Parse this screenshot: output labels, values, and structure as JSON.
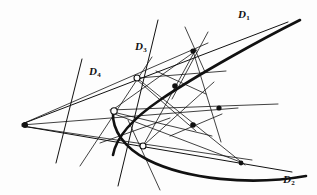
{
  "figure": {
    "kind": "geometry-construction",
    "background_color": "#fdfdfd",
    "ink_color": "#111111",
    "width": 317,
    "height": 195
  },
  "labels": [
    {
      "name": "label-d1",
      "base": "D",
      "sub": "1",
      "text": "D1",
      "x": 238,
      "y": 9,
      "of": "tangent-line-d1"
    },
    {
      "name": "label-d2",
      "base": "D",
      "sub": "2",
      "text": "D2",
      "x": 283,
      "y": 174,
      "of": "tangent-line-d2"
    },
    {
      "name": "label-d3",
      "base": "D",
      "sub": "3",
      "text": "D3",
      "x": 135,
      "y": 41,
      "of": "tangent-line-d3"
    },
    {
      "name": "label-d4",
      "base": "D",
      "sub": "4",
      "text": "D4",
      "x": 89,
      "y": 66,
      "of": "tangent-line-d4"
    }
  ],
  "curve": {
    "name": "parabola",
    "type": "parabola",
    "opens": "right",
    "vertex": [
      113,
      112
    ],
    "stroke_width": 2.6,
    "path_points": [
      [
        296,
        22
      ],
      [
        268,
        36
      ],
      [
        243,
        49
      ],
      [
        220,
        62
      ],
      [
        200,
        74
      ],
      [
        182,
        86
      ],
      [
        166,
        98
      ],
      [
        152,
        110
      ],
      [
        140,
        122
      ],
      [
        131,
        134
      ],
      [
        124,
        146
      ],
      [
        120,
        158
      ],
      [
        119,
        170
      ],
      [
        121,
        182
      ],
      [
        116,
        100
      ],
      [
        113,
        112
      ]
    ],
    "upper_branch": "M 300 20 C 262 39 200 73 160 100 C 132 119 116 138 113 155",
    "lower_branch": "M 113 112 C 112 130 124 148 148 160 C 186 179 250 186 306 176"
  },
  "tangent_lines": [
    {
      "name": "tangent-line-d1",
      "label": "D1",
      "x1": 22,
      "y1": 124,
      "x2": 288,
      "y2": 22,
      "stroke_width": 1.0,
      "touches": "upper-branch"
    },
    {
      "name": "tangent-line-d2",
      "label": "D2",
      "x1": 22,
      "y1": 126,
      "x2": 292,
      "y2": 172,
      "stroke_width": 1.0,
      "touches": "lower-branch"
    },
    {
      "name": "tangent-line-d3",
      "label": "D3",
      "x1": 158,
      "y1": 20,
      "x2": 118,
      "y2": 186,
      "stroke_width": 1.0,
      "touches": "curve-point-t1"
    },
    {
      "name": "tangent-line-d4",
      "label": "D4",
      "x1": 82,
      "y1": 59,
      "x2": 56,
      "y2": 163,
      "stroke_width": 1.0,
      "touches": "curve-point-t2"
    }
  ],
  "construction_lines": [
    {
      "name": "construction-line-1",
      "x1": 22,
      "y1": 124,
      "x2": 208,
      "y2": 43,
      "stroke_width": 0.8
    },
    {
      "name": "construction-line-2",
      "x1": 22,
      "y1": 125,
      "x2": 238,
      "y2": 108,
      "stroke_width": 0.8
    },
    {
      "name": "construction-line-3",
      "x1": 22,
      "y1": 126,
      "x2": 252,
      "y2": 160,
      "stroke_width": 0.8
    },
    {
      "name": "construction-line-4",
      "x1": 110,
      "y1": 110,
      "x2": 278,
      "y2": 104,
      "stroke_width": 0.8
    },
    {
      "name": "construction-line-5",
      "x1": 137,
      "y1": 78,
      "x2": 245,
      "y2": 165,
      "stroke_width": 0.8
    },
    {
      "name": "construction-line-6",
      "x1": 143,
      "y1": 146,
      "x2": 196,
      "y2": 49,
      "stroke_width": 0.8
    },
    {
      "name": "construction-line-7",
      "x1": 111,
      "y1": 111,
      "x2": 197,
      "y2": 50,
      "stroke_width": 0.8
    },
    {
      "name": "construction-line-8",
      "x1": 112,
      "y1": 113,
      "x2": 243,
      "y2": 163,
      "stroke_width": 0.8
    },
    {
      "name": "construction-line-9",
      "x1": 136,
      "y1": 79,
      "x2": 196,
      "y2": 131,
      "stroke_width": 0.8
    },
    {
      "name": "construction-line-10",
      "x1": 144,
      "y1": 145,
      "x2": 214,
      "y2": 82,
      "stroke_width": 0.8
    },
    {
      "name": "construction-line-11",
      "x1": 193,
      "y1": 51,
      "x2": 221,
      "y2": 142,
      "stroke_width": 0.8
    },
    {
      "name": "construction-line-12",
      "x1": 156,
      "y1": 71,
      "x2": 206,
      "y2": 94,
      "stroke_width": 0.8
    },
    {
      "name": "construction-line-13",
      "x1": 170,
      "y1": 136,
      "x2": 222,
      "y2": 114,
      "stroke_width": 0.8
    },
    {
      "name": "construction-line-14",
      "x1": 185,
      "y1": 27,
      "x2": 205,
      "y2": 72,
      "stroke_width": 0.8
    },
    {
      "name": "construction-line-15",
      "x1": 208,
      "y1": 32,
      "x2": 172,
      "y2": 99,
      "stroke_width": 0.8
    },
    {
      "name": "construction-line-16",
      "x1": 100,
      "y1": 143,
      "x2": 170,
      "y2": 118,
      "stroke_width": 0.8
    },
    {
      "name": "construction-line-17",
      "x1": 80,
      "y1": 166,
      "x2": 152,
      "y2": 57,
      "stroke_width": 0.8
    },
    {
      "name": "construction-line-18",
      "x1": 160,
      "y1": 190,
      "x2": 128,
      "y2": 120,
      "stroke_width": 0.8
    },
    {
      "name": "construction-line-19",
      "x1": 113,
      "y1": 112,
      "x2": 212,
      "y2": 136,
      "stroke_width": 0.8
    },
    {
      "name": "construction-line-20",
      "x1": 138,
      "y1": 78,
      "x2": 226,
      "y2": 71,
      "stroke_width": 0.8
    }
  ],
  "open_points": [
    {
      "name": "curve-point-t1",
      "x": 137,
      "y": 78,
      "r": 3.0,
      "style": "hollow"
    },
    {
      "name": "curve-point-t2",
      "x": 114,
      "y": 111,
      "r": 3.2,
      "style": "hollow"
    },
    {
      "name": "curve-point-t3",
      "x": 143,
      "y": 146,
      "r": 3.0,
      "style": "hollow"
    }
  ],
  "filled_points": [
    {
      "name": "pole-point-left",
      "x": 25,
      "y": 125,
      "r": 3.0,
      "style": "filled"
    },
    {
      "name": "curve-point-upper-right",
      "x": 193,
      "y": 51,
      "r": 2.6,
      "style": "filled"
    },
    {
      "name": "interior-point-a",
      "x": 175,
      "y": 86,
      "r": 2.8,
      "style": "filled"
    },
    {
      "name": "interior-point-b",
      "x": 193,
      "y": 125,
      "r": 2.8,
      "style": "filled"
    },
    {
      "name": "interior-point-c",
      "x": 219,
      "y": 108,
      "r": 2.6,
      "style": "filled"
    },
    {
      "name": "curve-point-lower-right",
      "x": 241,
      "y": 163,
      "r": 2.4,
      "style": "filled"
    }
  ]
}
